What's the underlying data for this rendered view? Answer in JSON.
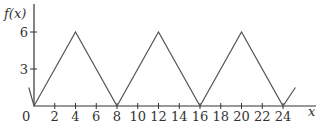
{
  "chart_data": {
    "type": "line",
    "title": "",
    "xlabel": "x",
    "ylabel": "f(x)",
    "origin_label": "0",
    "x": [
      -0.5,
      0,
      4,
      8,
      12,
      16,
      20,
      24,
      25.2
    ],
    "y": [
      1.5,
      0,
      6,
      0,
      6,
      0,
      6,
      0,
      1.5
    ],
    "series": [
      {
        "name": "f(x)",
        "x": [
          -0.5,
          0,
          4,
          8,
          12,
          16,
          20,
          24,
          25.2
        ],
        "values": [
          1.5,
          0,
          6,
          0,
          6,
          0,
          6,
          0,
          1.5
        ]
      }
    ],
    "xticks": [
      2,
      4,
      6,
      8,
      10,
      12,
      14,
      16,
      18,
      20,
      22,
      24
    ],
    "xtick_labels": [
      "2",
      "4",
      "6",
      "8",
      "10",
      "12",
      "14",
      "16",
      "18",
      "20",
      "22",
      "24"
    ],
    "yticks": [
      3,
      6
    ],
    "ytick_labels": [
      "3",
      "6"
    ],
    "xlim": [
      0,
      27
    ],
    "ylim": [
      0,
      7.2
    ],
    "grid": false,
    "legend": "none",
    "line_color": "#555555",
    "axis_color": "#333333"
  }
}
